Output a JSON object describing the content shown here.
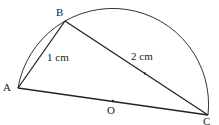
{
  "diagram": {
    "points": {
      "A": {
        "label": "A",
        "x": 18,
        "y": 88
      },
      "B": {
        "label": "B",
        "x": 65,
        "y": 21
      },
      "C": {
        "label": "C",
        "x": 208,
        "y": 115
      },
      "O": {
        "label": "O",
        "x": 113,
        "y": 101
      }
    },
    "segments": [
      {
        "from": "A",
        "to": "B",
        "label": "1 cm"
      },
      {
        "from": "B",
        "to": "C",
        "label": "2 cm"
      },
      {
        "from": "A",
        "to": "C",
        "label": ""
      }
    ],
    "arc": {
      "from": "A",
      "to": "C",
      "via": "B",
      "type": "semicircle"
    },
    "colors": {
      "stroke": "#222222"
    }
  }
}
